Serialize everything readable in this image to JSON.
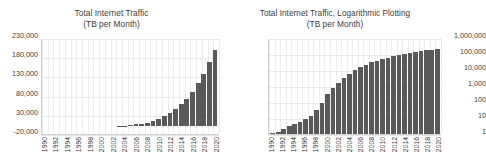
{
  "chart_data": [
    {
      "type": "bar",
      "id": "linear",
      "title": "Total Internet Traffic",
      "subtitle": "(TB per Month)",
      "xlabel": "",
      "ylabel": "",
      "scale": "linear",
      "ylim": [
        -20000,
        230000
      ],
      "yticks": [
        "-20,000",
        "30,000",
        "80,000",
        "130,000",
        "180,000",
        "230,000"
      ],
      "ytick_values": [
        -20000,
        30000,
        80000,
        130000,
        180000,
        230000
      ],
      "grid": "both",
      "legend": "none",
      "bar_color": "#595959",
      "x": [
        1990,
        1991,
        1992,
        1993,
        1994,
        1995,
        1996,
        1997,
        1998,
        1999,
        2000,
        2001,
        2002,
        2003,
        2004,
        2005,
        2006,
        2007,
        2008,
        2009,
        2010,
        2011,
        2012,
        2013,
        2014,
        2015,
        2016,
        2017,
        2018,
        2019,
        2020
      ],
      "xtick_labels": [
        "1990",
        "1992",
        "1994",
        "1996",
        "1998",
        "2000",
        "2002",
        "2004",
        "2006",
        "2008",
        "2010",
        "2012",
        "2014",
        "2016",
        "2018",
        "2020"
      ],
      "values": [
        1,
        2,
        4,
        8,
        16,
        32,
        64,
        150,
        350,
        800,
        1500,
        2500,
        4000,
        6000,
        8000,
        12000,
        16000,
        22000,
        30000,
        40000,
        52000,
        65000,
        80000,
        100000,
        125000,
        155000,
        190000,
        230000,
        280000,
        340000,
        400000
      ],
      "values_plotted": [
        0,
        0,
        0,
        0,
        0,
        0,
        0,
        0,
        0,
        0,
        0,
        0,
        0,
        1000,
        2000,
        3000,
        5000,
        7000,
        10000,
        14000,
        19000,
        26000,
        34000,
        44000,
        57000,
        71000,
        90000,
        113000,
        136000,
        168000,
        198000
      ]
    },
    {
      "type": "bar",
      "id": "logarithmic",
      "title": "Total Internet Traffic, Logarithmic Plotting",
      "subtitle": "(TB per Month)",
      "xlabel": "",
      "ylabel": "",
      "scale": "log",
      "ylim": [
        1,
        1000000
      ],
      "yticks": [
        "1",
        "10",
        "100",
        "1,000",
        "10,000",
        "100,000",
        "1,000,000"
      ],
      "ytick_values": [
        1,
        10,
        100,
        1000,
        10000,
        100000,
        1000000
      ],
      "grid": "both",
      "legend": "none",
      "bar_color": "#595959",
      "x": [
        1990,
        1991,
        1992,
        1993,
        1994,
        1995,
        1996,
        1997,
        1998,
        1999,
        2000,
        2001,
        2002,
        2003,
        2004,
        2005,
        2006,
        2007,
        2008,
        2009,
        2010,
        2011,
        2012,
        2013,
        2014,
        2015,
        2016,
        2017,
        2018,
        2019,
        2020
      ],
      "xtick_labels": [
        "1990",
        "1992",
        "1994",
        "1996",
        "1998",
        "2000",
        "2002",
        "2004",
        "2006",
        "2008",
        "2010",
        "2012",
        "2014",
        "2016",
        "2018",
        "2020"
      ],
      "values": [
        1.2,
        1.4,
        2,
        3,
        4.5,
        6,
        9,
        14,
        30,
        90,
        300,
        700,
        1500,
        3000,
        6000,
        10000,
        16000,
        22000,
        30000,
        38000,
        48000,
        58000,
        70000,
        85000,
        100000,
        118000,
        136000,
        155000,
        172000,
        190000,
        205000
      ]
    }
  ],
  "panels": {
    "linear": {
      "title_line1": "Total Internet Traffic",
      "title_line2": "(TB per Month)"
    },
    "log": {
      "title_line1": "Total Internet Traffic, Logarithmic Plotting",
      "title_line2": "(TB per Month)"
    }
  }
}
